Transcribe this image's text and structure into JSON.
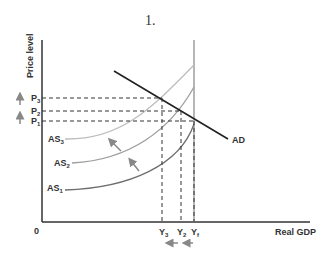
{
  "figure": {
    "number_label": "1.",
    "y_axis_label": "Price level",
    "x_axis_label": "Real GDP",
    "origin_label": "0",
    "price_labels": [
      {
        "base": "P",
        "sub": "3"
      },
      {
        "base": "P",
        "sub": "2"
      },
      {
        "base": "P",
        "sub": "1"
      }
    ],
    "output_labels": [
      {
        "base": "Y",
        "sub": "3"
      },
      {
        "base": "Y",
        "sub": "2"
      },
      {
        "base": "Y",
        "sub": "f"
      }
    ],
    "curves": [
      {
        "base": "AS",
        "sub": "3",
        "color": "#bdbdbd"
      },
      {
        "base": "AS",
        "sub": "2",
        "color": "#9e9e9e"
      },
      {
        "base": "AS",
        "sub": "1",
        "color": "#6e6e6e"
      }
    ],
    "demand_label": "AD",
    "colors": {
      "axis": "#333333",
      "ad": "#222222",
      "arrows": "#888888",
      "lras": "#9e9e9e"
    }
  }
}
